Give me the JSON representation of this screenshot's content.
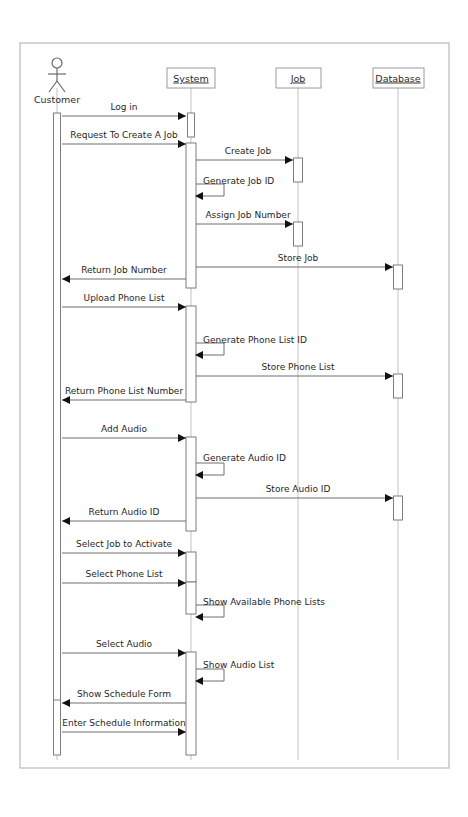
{
  "diagram": {
    "kind": "uml-sequence-diagram",
    "frame": {
      "x": 20,
      "y": 43,
      "width": 429,
      "height": 725
    },
    "canvas": {
      "width": 468,
      "height": 817
    },
    "colors": {
      "background": "#ffffff",
      "frame_stroke": "#b9b9b9",
      "lifeline_stroke": "#c2c2c2",
      "activation_stroke": "#7d7d7d",
      "message_stroke": "#6e6e6e",
      "arrow_fill": "#111111",
      "text": "#1f1f1f"
    }
  },
  "participants": [
    {
      "id": "customer",
      "label": "Customer",
      "type": "actor",
      "x": 57,
      "label_y": 103,
      "lifeline_top": 88,
      "lifeline_bottom": 760
    },
    {
      "id": "system",
      "label": "System",
      "type": "object",
      "x": 191,
      "box": {
        "x": 167,
        "y": 68,
        "width": 48,
        "height": 20
      },
      "lifeline_top": 88,
      "lifeline_bottom": 760
    },
    {
      "id": "job",
      "label": "Job",
      "type": "object",
      "x": 298,
      "box": {
        "x": 276,
        "y": 68,
        "width": 45,
        "height": 20
      },
      "lifeline_top": 88,
      "lifeline_bottom": 760
    },
    {
      "id": "database",
      "label": "Database",
      "type": "object",
      "x": 398,
      "box": {
        "x": 373,
        "y": 68,
        "width": 51,
        "height": 20
      },
      "lifeline_top": 88,
      "lifeline_bottom": 760
    }
  ],
  "activations": [
    {
      "participant": "customer",
      "x": 57,
      "y": 113,
      "height": 593,
      "width": 7
    },
    {
      "participant": "customer",
      "x": 57,
      "y": 700,
      "height": 55,
      "width": 7
    },
    {
      "participant": "system",
      "x": 191,
      "y": 113,
      "height": 24,
      "width": 7
    },
    {
      "participant": "system",
      "x": 191,
      "y": 143,
      "height": 145,
      "width": 10
    },
    {
      "participant": "system",
      "x": 191,
      "y": 306,
      "height": 96,
      "width": 10
    },
    {
      "participant": "system",
      "x": 191,
      "y": 437,
      "height": 94,
      "width": 10
    },
    {
      "participant": "system",
      "x": 191,
      "y": 552,
      "height": 30,
      "width": 10
    },
    {
      "participant": "system",
      "x": 191,
      "y": 582,
      "height": 32,
      "width": 10
    },
    {
      "participant": "system",
      "x": 191,
      "y": 652,
      "height": 103,
      "width": 10
    },
    {
      "participant": "job",
      "x": 298,
      "y": 158,
      "height": 24,
      "width": 9
    },
    {
      "participant": "job",
      "x": 298,
      "y": 222,
      "height": 24,
      "width": 9
    },
    {
      "participant": "database",
      "x": 398,
      "y": 265,
      "height": 24,
      "width": 9
    },
    {
      "participant": "database",
      "x": 398,
      "y": 374,
      "height": 24,
      "width": 9
    },
    {
      "participant": "database",
      "x": 398,
      "y": 496,
      "height": 24,
      "width": 9
    }
  ],
  "messages": [
    {
      "index": 1,
      "label": "Log in",
      "from": "customer",
      "to": "system",
      "y": 116,
      "dir": "right",
      "kind": "call",
      "label_x": 124,
      "label_y": 110
    },
    {
      "index": 2,
      "label": "Request To Create A Job",
      "from": "customer",
      "to": "system",
      "y": 144,
      "dir": "right",
      "kind": "call",
      "label_x": 124,
      "label_y": 138
    },
    {
      "index": 3,
      "label": "Create Job",
      "from": "system",
      "to": "job",
      "y": 160,
      "dir": "right",
      "kind": "call",
      "label_x": 248,
      "label_y": 154
    },
    {
      "index": 4,
      "label": "Generate Job ID",
      "from": "system",
      "to": "system",
      "y": 196,
      "dir": "self",
      "kind": "self",
      "label_x": 203,
      "label_y": 184,
      "loop_width": 28
    },
    {
      "index": 5,
      "label": "Assign Job Number",
      "from": "system",
      "to": "job",
      "y": 224,
      "dir": "right",
      "kind": "call",
      "label_x": 248,
      "label_y": 218
    },
    {
      "index": 6,
      "label": "Store Job",
      "from": "system",
      "to": "database",
      "y": 267,
      "dir": "right",
      "kind": "call",
      "label_x": 298,
      "label_y": 261
    },
    {
      "index": 7,
      "label": "Return Job Number",
      "from": "system",
      "to": "customer",
      "y": 279,
      "dir": "left",
      "kind": "return",
      "label_x": 124,
      "label_y": 273
    },
    {
      "index": 8,
      "label": "Upload Phone List",
      "from": "customer",
      "to": "system",
      "y": 307,
      "dir": "right",
      "kind": "call",
      "label_x": 124,
      "label_y": 301
    },
    {
      "index": 9,
      "label": "Generate Phone List ID",
      "from": "system",
      "to": "system",
      "y": 355,
      "dir": "self",
      "kind": "self",
      "label_x": 203,
      "label_y": 343,
      "loop_width": 28
    },
    {
      "index": 10,
      "label": "Store Phone List",
      "from": "system",
      "to": "database",
      "y": 376,
      "dir": "right",
      "kind": "call",
      "label_x": 298,
      "label_y": 370
    },
    {
      "index": 11,
      "label": "Return Phone List Number",
      "from": "system",
      "to": "customer",
      "y": 400,
      "dir": "left",
      "kind": "return",
      "label_x": 124,
      "label_y": 394
    },
    {
      "index": 12,
      "label": "Add Audio",
      "from": "customer",
      "to": "system",
      "y": 438,
      "dir": "right",
      "kind": "call",
      "label_x": 124,
      "label_y": 432
    },
    {
      "index": 13,
      "label": "Generate Audio ID",
      "from": "system",
      "to": "system",
      "y": 475,
      "dir": "self",
      "kind": "self",
      "label_x": 203,
      "label_y": 461,
      "loop_width": 28
    },
    {
      "index": 14,
      "label": "Store Audio ID",
      "from": "system",
      "to": "database",
      "y": 498,
      "dir": "right",
      "kind": "call",
      "label_x": 298,
      "label_y": 492
    },
    {
      "index": 15,
      "label": "Return Audio ID",
      "from": "system",
      "to": "customer",
      "y": 521,
      "dir": "left",
      "kind": "return",
      "label_x": 124,
      "label_y": 515
    },
    {
      "index": 16,
      "label": "Select Job to Activate",
      "from": "customer",
      "to": "system",
      "y": 553,
      "dir": "right",
      "kind": "call",
      "label_x": 124,
      "label_y": 547
    },
    {
      "index": 17,
      "label": "Select Phone List",
      "from": "customer",
      "to": "system",
      "y": 583,
      "dir": "right",
      "kind": "call",
      "label_x": 124,
      "label_y": 577
    },
    {
      "index": 18,
      "label": "Show Available Phone Lists",
      "from": "system",
      "to": "system",
      "y": 617,
      "dir": "self",
      "kind": "self",
      "label_x": 203,
      "label_y": 605,
      "loop_width": 28
    },
    {
      "index": 19,
      "label": "Select Audio",
      "from": "customer",
      "to": "system",
      "y": 653,
      "dir": "right",
      "kind": "call",
      "label_x": 124,
      "label_y": 647
    },
    {
      "index": 20,
      "label": "Show Audio List",
      "from": "system",
      "to": "system",
      "y": 681,
      "dir": "self",
      "kind": "self",
      "label_x": 203,
      "label_y": 668,
      "loop_width": 28
    },
    {
      "index": 21,
      "label": "Show Schedule Form",
      "from": "system",
      "to": "customer",
      "y": 703,
      "dir": "left",
      "kind": "return",
      "label_x": 124,
      "label_y": 697
    },
    {
      "index": 22,
      "label": "Enter Schedule Information",
      "from": "customer",
      "to": "system",
      "y": 732,
      "dir": "right",
      "kind": "call",
      "label_x": 124,
      "label_y": 726
    }
  ]
}
